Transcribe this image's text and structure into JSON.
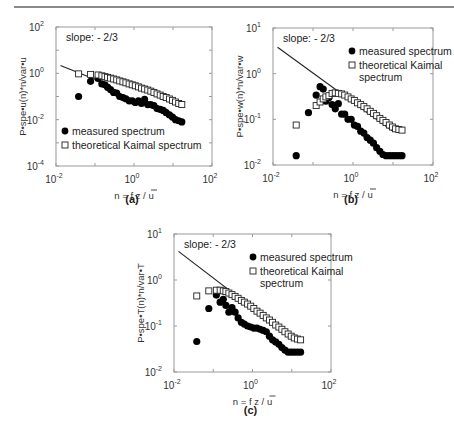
{
  "page": {
    "header_rule": true
  },
  "chart_data": [
    {
      "id": "a",
      "type": "scatter",
      "caption": "(a)",
      "xscale": "log",
      "yscale": "log",
      "xlim": [
        0.01,
        100
      ],
      "ylim": [
        0.0001,
        100
      ],
      "xticks": [
        {
          "exp": "-2",
          "v": 0.01
        },
        {
          "exp": "0",
          "v": 1
        },
        {
          "exp": "2",
          "v": 100
        }
      ],
      "yticks": [
        {
          "exp": "-4",
          "v": 0.0001
        },
        {
          "exp": "-2",
          "v": 0.01
        },
        {
          "exp": "0",
          "v": 1
        },
        {
          "exp": "2",
          "v": 100
        }
      ],
      "xlabel": "n = f z / u",
      "ylabel": "P•spe•u(n)*n/var•u",
      "annotation": "slope: - 2/3",
      "legend": {
        "position": "lower-left",
        "entries": [
          "measured spectrum",
          "theoretical Kaimal spectrum"
        ]
      },
      "slope_line": {
        "x": [
          0.013,
          0.25
        ],
        "y": [
          2.2,
          0.3
        ]
      },
      "series": [
        {
          "name": "measured spectrum",
          "marker": "filled-circle",
          "x": [
            0.038,
            0.077,
            0.12,
            0.15,
            0.18,
            0.21,
            0.25,
            0.3,
            0.36,
            0.43,
            0.52,
            0.62,
            0.75,
            0.9,
            1.08,
            1.3,
            1.56,
            1.87,
            2.25,
            2.7,
            3.24,
            3.9,
            4.7,
            5.6,
            6.7,
            8.1,
            9.7,
            11.6,
            14,
            16.8
          ],
          "y": [
            0.1,
            0.45,
            0.6,
            0.35,
            0.32,
            0.25,
            0.2,
            0.15,
            0.14,
            0.1,
            0.09,
            0.08,
            0.065,
            0.065,
            0.055,
            0.065,
            0.05,
            0.075,
            0.045,
            0.045,
            0.04,
            0.03,
            0.028,
            0.025,
            0.02,
            0.016,
            0.013,
            0.01,
            0.009,
            0.008
          ]
        },
        {
          "name": "theoretical Kaimal spectrum",
          "marker": "open-square",
          "x": [
            0.038,
            0.077,
            0.12,
            0.15,
            0.18,
            0.21,
            0.25,
            0.3,
            0.36,
            0.43,
            0.52,
            0.62,
            0.75,
            0.9,
            1.08,
            1.3,
            1.56,
            1.87,
            2.25,
            2.7,
            3.24,
            3.9,
            4.7,
            5.6,
            6.7,
            8.1,
            9.7,
            11.6,
            14,
            16.8
          ],
          "y": [
            0.95,
            0.9,
            0.85,
            0.78,
            0.72,
            0.67,
            0.62,
            0.57,
            0.52,
            0.47,
            0.43,
            0.39,
            0.35,
            0.32,
            0.29,
            0.26,
            0.23,
            0.21,
            0.19,
            0.17,
            0.15,
            0.13,
            0.115,
            0.1,
            0.09,
            0.078,
            0.068,
            0.058,
            0.05,
            0.045
          ]
        }
      ]
    },
    {
      "id": "b",
      "type": "scatter",
      "caption": "(b)",
      "xscale": "log",
      "yscale": "log",
      "xlim": [
        0.01,
        100
      ],
      "ylim": [
        0.01,
        10
      ],
      "xticks": [
        {
          "exp": "-2",
          "v": 0.01
        },
        {
          "exp": "0",
          "v": 1
        },
        {
          "exp": "2",
          "v": 100
        }
      ],
      "yticks": [
        {
          "exp": "-2",
          "v": 0.01
        },
        {
          "exp": "-1",
          "v": 0.1
        },
        {
          "exp": "0",
          "v": 1
        },
        {
          "exp": "1",
          "v": 10
        }
      ],
      "xlabel": "n = f z / u",
      "ylabel": "P•spe•w(n)*n/var•w",
      "annotation": "slope: - 2/3",
      "legend": {
        "position": "upper-right",
        "entries": [
          "measured spectrum",
          "theoretical Kaimal spectrum"
        ]
      },
      "slope_line": {
        "x": [
          0.013,
          10
        ],
        "y": [
          3.8,
          0.055
        ]
      },
      "series": [
        {
          "name": "measured spectrum",
          "marker": "filled-circle",
          "x": [
            0.038,
            0.077,
            0.12,
            0.15,
            0.18,
            0.21,
            0.25,
            0.3,
            0.36,
            0.43,
            0.52,
            0.62,
            0.75,
            0.9,
            1.08,
            1.3,
            1.56,
            1.87,
            2.25,
            2.7,
            3.24,
            3.9,
            4.7,
            5.6,
            6.7,
            8.1,
            9.7,
            11.6,
            14,
            16.8
          ],
          "y": [
            0.016,
            0.14,
            0.34,
            0.52,
            0.46,
            0.25,
            0.3,
            0.21,
            0.17,
            0.22,
            0.13,
            0.13,
            0.1,
            0.1,
            0.075,
            0.07,
            0.055,
            0.05,
            0.04,
            0.035,
            0.03,
            0.024,
            0.02,
            0.017,
            0.016,
            0.016,
            0.016,
            0.016,
            0.016,
            0.016
          ]
        },
        {
          "name": "theoretical Kaimal spectrum",
          "marker": "open-square",
          "x": [
            0.038,
            0.12,
            0.15,
            0.18,
            0.21,
            0.25,
            0.3,
            0.36,
            0.43,
            0.52,
            0.62,
            0.75,
            0.9,
            1.08,
            1.3,
            1.56,
            1.87,
            2.25,
            2.7,
            3.24,
            3.9,
            4.7,
            5.6,
            6.7,
            8.1,
            9.7,
            11.6,
            14,
            16.8
          ],
          "y": [
            0.075,
            0.2,
            0.24,
            0.28,
            0.31,
            0.33,
            0.37,
            0.38,
            0.37,
            0.36,
            0.34,
            0.31,
            0.28,
            0.26,
            0.23,
            0.21,
            0.19,
            0.17,
            0.15,
            0.135,
            0.12,
            0.105,
            0.095,
            0.085,
            0.075,
            0.068,
            0.062,
            0.06,
            0.058
          ]
        }
      ]
    },
    {
      "id": "c",
      "type": "scatter",
      "caption": "(c)",
      "xscale": "log",
      "yscale": "log",
      "xlim": [
        0.01,
        100
      ],
      "ylim": [
        0.01,
        10
      ],
      "xticks": [
        {
          "exp": "-2",
          "v": 0.01
        },
        {
          "exp": "0",
          "v": 1
        },
        {
          "exp": "2",
          "v": 100
        }
      ],
      "yticks": [
        {
          "exp": "-2",
          "v": 0.01
        },
        {
          "exp": "-1",
          "v": 0.1
        },
        {
          "exp": "0",
          "v": 1
        },
        {
          "exp": "1",
          "v": 10
        }
      ],
      "xlabel": "n = f z / u",
      "ylabel": "P•spe•T(n)*n/var•T",
      "annotation": "slope: - 2/3",
      "legend": {
        "position": "upper-right",
        "entries": [
          "measured spectrum",
          "theoretical Kaimal spectrum"
        ]
      },
      "slope_line": {
        "x": [
          0.013,
          10
        ],
        "y": [
          4.2,
          0.055
        ]
      },
      "series": [
        {
          "name": "measured spectrum",
          "marker": "filled-circle",
          "x": [
            0.038,
            0.077,
            0.12,
            0.15,
            0.18,
            0.21,
            0.25,
            0.3,
            0.36,
            0.43,
            0.52,
            0.62,
            0.75,
            0.9,
            1.08,
            1.3,
            1.56,
            1.87,
            2.25,
            2.7,
            3.24,
            3.9,
            4.7,
            5.6,
            6.7,
            8.1,
            9.7,
            11.6,
            14,
            16.8
          ],
          "y": [
            0.046,
            0.24,
            0.47,
            0.33,
            0.38,
            0.28,
            0.2,
            0.25,
            0.2,
            0.15,
            0.12,
            0.11,
            0.1,
            0.095,
            0.09,
            0.09,
            0.085,
            0.08,
            0.075,
            0.06,
            0.05,
            0.045,
            0.04,
            0.034,
            0.03,
            0.027,
            0.027,
            0.027,
            0.027,
            0.027
          ]
        },
        {
          "name": "theoretical Kaimal spectrum",
          "marker": "open-square",
          "x": [
            0.038,
            0.077,
            0.12,
            0.15,
            0.18,
            0.21,
            0.25,
            0.3,
            0.36,
            0.43,
            0.52,
            0.62,
            0.75,
            0.9,
            1.08,
            1.3,
            1.56,
            1.87,
            2.25,
            2.7,
            3.24,
            3.9,
            4.7,
            5.6,
            6.7,
            8.1,
            9.7,
            11.6,
            14,
            16.8
          ],
          "y": [
            0.45,
            0.58,
            0.6,
            0.6,
            0.58,
            0.56,
            0.52,
            0.48,
            0.44,
            0.4,
            0.36,
            0.33,
            0.3,
            0.27,
            0.24,
            0.21,
            0.19,
            0.17,
            0.15,
            0.135,
            0.12,
            0.105,
            0.095,
            0.085,
            0.075,
            0.067,
            0.06,
            0.055,
            0.052,
            0.05
          ]
        }
      ]
    }
  ],
  "layout": {
    "plots": {
      "a": {
        "left": 56,
        "top": 27,
        "right": 212,
        "bottom": 166,
        "caption_y": 203
      },
      "b": {
        "left": 273,
        "top": 28,
        "right": 433,
        "bottom": 165,
        "caption_y": 203
      },
      "c": {
        "left": 174,
        "top": 234,
        "right": 331,
        "bottom": 372,
        "caption_y": 414
      }
    }
  }
}
